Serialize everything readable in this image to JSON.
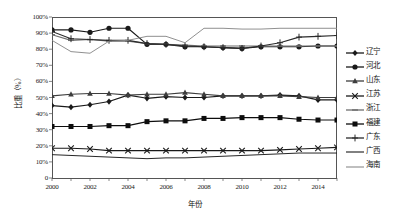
{
  "axes": {
    "y_title": "比重（%）",
    "x_title": "年份",
    "y_ticks": [
      "100%",
      "90%",
      "80%",
      "70%",
      "60%",
      "50%",
      "40%",
      "30%",
      "20%",
      "10%",
      "0"
    ],
    "x_ticks": [
      "2000",
      "2002",
      "2004",
      "2006",
      "2008",
      "2010",
      "2012",
      "2014"
    ]
  },
  "legend": {
    "items": [
      {
        "label": "辽宁",
        "marker": "diamond",
        "color": "#1a1a1a"
      },
      {
        "label": "河北",
        "marker": "circle",
        "color": "#1a1a1a"
      },
      {
        "label": "山东",
        "marker": "triangle",
        "color": "#3d3d3d"
      },
      {
        "label": "江苏",
        "marker": "cross",
        "color": "#1a1a1a"
      },
      {
        "label": "浙江",
        "marker": "dash",
        "color": "#6e6e6e"
      },
      {
        "label": "福建",
        "marker": "square",
        "color": "#0d0d0d"
      },
      {
        "label": "广东",
        "marker": "plus",
        "color": "#2b2b2b"
      },
      {
        "label": "广西",
        "marker": "none",
        "color": "#1a1a1a"
      },
      {
        "label": "海南",
        "marker": "none",
        "color": "#8a8a8a"
      }
    ]
  },
  "chart_data": {
    "type": "line",
    "title": "",
    "xlabel": "年份",
    "ylabel": "比重（%）",
    "xlim": [
      2000,
      2015
    ],
    "ylim": [
      0,
      100
    ],
    "grid": false,
    "legend_position": "right",
    "x": [
      2000,
      2001,
      2002,
      2003,
      2004,
      2005,
      2006,
      2007,
      2008,
      2009,
      2010,
      2011,
      2012,
      2013,
      2014,
      2015
    ],
    "series": [
      {
        "name": "辽宁",
        "marker": "diamond",
        "color": "#1a1a1a",
        "values": [
          45,
          44,
          45.5,
          47.5,
          51.5,
          49.5,
          50.5,
          50,
          50,
          51,
          51,
          51,
          51.5,
          51,
          48.5,
          48.5
        ]
      },
      {
        "name": "河北",
        "marker": "circle",
        "color": "#1a1a1a",
        "values": [
          92,
          92,
          90.5,
          93,
          93,
          83,
          83,
          81.5,
          81.5,
          81,
          80.5,
          81.5,
          81.5,
          81.5,
          82,
          82
        ]
      },
      {
        "name": "山东",
        "marker": "triangle",
        "color": "#3d3d3d",
        "values": [
          51,
          52,
          52.5,
          52.5,
          51.5,
          52,
          52,
          53,
          52,
          51,
          51,
          51,
          51,
          50.5,
          50,
          50
        ]
      },
      {
        "name": "江苏",
        "marker": "cross",
        "color": "#1a1a1a",
        "values": [
          18.5,
          18.5,
          18,
          17,
          17,
          17,
          17,
          17,
          17,
          17,
          17,
          17,
          17.5,
          18,
          18.5,
          19
        ]
      },
      {
        "name": "浙江",
        "marker": "dash",
        "color": "#6e6e6e",
        "values": [
          89,
          85.5,
          86,
          85,
          85,
          83.5,
          83,
          82.5,
          82,
          82,
          82,
          82,
          82,
          82,
          82,
          82
        ]
      },
      {
        "name": "福建",
        "marker": "square",
        "color": "#0d0d0d",
        "values": [
          32,
          32,
          32,
          32.5,
          32.5,
          35,
          35.5,
          35.5,
          37,
          37,
          37.5,
          37.5,
          37.5,
          36.5,
          36,
          36
        ]
      },
      {
        "name": "广东",
        "marker": "plus",
        "color": "#2b2b2b",
        "values": [
          91,
          86.5,
          86,
          85.5,
          85.5,
          83.5,
          83,
          82,
          81.5,
          81,
          80.5,
          82,
          84,
          87.5,
          88,
          88.5
        ]
      },
      {
        "name": "广西",
        "marker": "none",
        "color": "#1a1a1a",
        "values": [
          14.5,
          14,
          13.5,
          13,
          12.5,
          12,
          12.5,
          12.5,
          13,
          13.5,
          14,
          14.5,
          15,
          15.5,
          15.5,
          15.5
        ]
      },
      {
        "name": "海南",
        "marker": "none",
        "color": "#8a8a8a",
        "values": [
          85.5,
          78.5,
          77.5,
          85,
          85.5,
          88,
          88,
          84,
          93,
          93,
          92.5,
          92.5,
          93,
          93,
          93,
          93
        ]
      }
    ]
  }
}
